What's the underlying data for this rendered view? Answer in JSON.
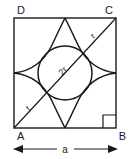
{
  "figure": {
    "background_color": "#ffffff",
    "line_color": "#1a1a1a",
    "vertices": {
      "top_left": "D",
      "top_right": "C",
      "bottom_left": "A",
      "bottom_right": "B"
    },
    "labels": {
      "circle_diameter": "2r",
      "diagonal_upper": "r",
      "diagonal_lower": "r",
      "side_dimension": "a"
    },
    "geometry": {
      "square_side_label": "a",
      "circle_label": "2r",
      "diagonal_from": "A",
      "diagonal_to": "C",
      "arc_count": 4,
      "right_angle_at": "B"
    }
  }
}
